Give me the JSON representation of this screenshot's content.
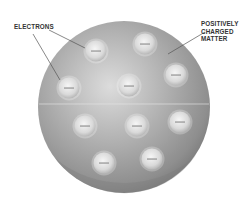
{
  "diagram": {
    "labels": {
      "electrons": "ELECTRONS",
      "positive": [
        "POSITIVELY",
        "CHARGED",
        "MATTER"
      ]
    },
    "sphere": {
      "cx": 124,
      "cy": 107,
      "r": 86,
      "color": "#9a9a9a"
    },
    "electrons": [
      {
        "cx": 96,
        "cy": 51
      },
      {
        "cx": 145,
        "cy": 44
      },
      {
        "cx": 69,
        "cy": 88
      },
      {
        "cx": 129,
        "cy": 86
      },
      {
        "cx": 176,
        "cy": 75
      },
      {
        "cx": 85,
        "cy": 126
      },
      {
        "cx": 137,
        "cy": 126
      },
      {
        "cx": 180,
        "cy": 122
      },
      {
        "cx": 104,
        "cy": 163
      },
      {
        "cx": 152,
        "cy": 159
      }
    ],
    "electron_symbol": "−"
  }
}
